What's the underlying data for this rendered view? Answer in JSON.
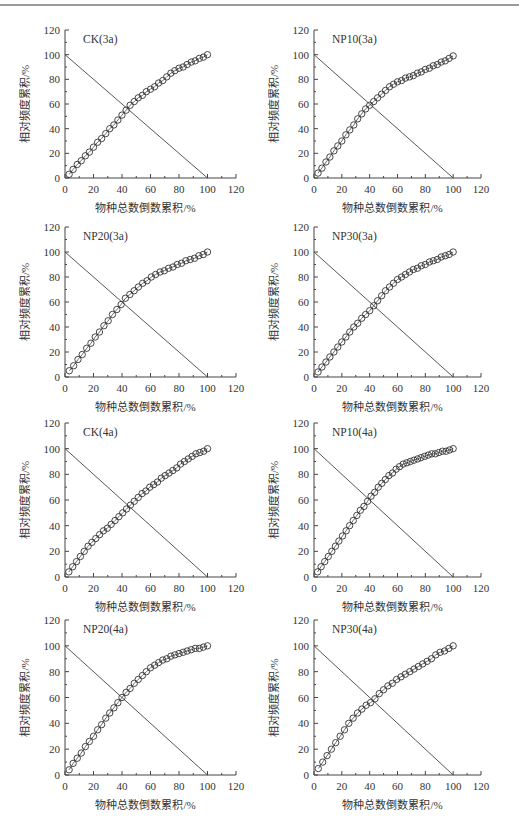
{
  "page": {
    "header_rule": true
  },
  "chart_data": [
    {
      "id": "ck-3a",
      "type": "scatter",
      "title": "CK(3a)",
      "xlabel": "物种总数倒数累积/%",
      "ylabel": "相对频度累积/%",
      "xlim": [
        0,
        120
      ],
      "ylim": [
        0,
        120
      ],
      "xticks": [
        0,
        20,
        40,
        60,
        80,
        100,
        120
      ],
      "yticks": [
        0,
        20,
        40,
        60,
        80,
        100,
        120
      ],
      "grid": false,
      "reference_line": {
        "x": [
          0,
          100
        ],
        "y": [
          100,
          0
        ]
      },
      "series": [
        {
          "name": "cumulative",
          "marker": "open-circle",
          "x": [
            2.9,
            5.7,
            8.6,
            11.4,
            14.3,
            17.1,
            20,
            22.9,
            25.7,
            28.6,
            31.4,
            34.3,
            37.1,
            40,
            42.9,
            45.7,
            48.6,
            51.4,
            54.3,
            57.1,
            60,
            62.9,
            65.7,
            68.6,
            71.4,
            74.3,
            77.1,
            80,
            82.9,
            85.7,
            88.6,
            91.4,
            94.3,
            97.1,
            100
          ],
          "y": [
            3,
            7,
            11,
            14,
            18,
            21,
            25,
            29,
            32,
            36,
            40,
            43,
            47,
            51,
            55,
            59,
            62,
            65,
            67,
            70,
            72,
            74,
            77,
            79,
            82,
            85,
            87,
            89,
            90,
            92,
            94,
            95,
            97,
            98,
            100
          ]
        }
      ]
    },
    {
      "id": "np10-3a",
      "type": "scatter",
      "title": "NP10(3a)",
      "xlabel": "物种总数倒数累积/%",
      "ylabel": "相对频度累积/%",
      "xlim": [
        0,
        120
      ],
      "ylim": [
        0,
        120
      ],
      "xticks": [
        0,
        20,
        40,
        60,
        80,
        100,
        120
      ],
      "yticks": [
        0,
        20,
        40,
        60,
        80,
        100,
        120
      ],
      "grid": false,
      "reference_line": {
        "x": [
          0,
          100
        ],
        "y": [
          100,
          0
        ]
      },
      "series": [
        {
          "name": "cumulative",
          "marker": "open-circle",
          "x": [
            2.9,
            5.7,
            8.6,
            11.4,
            14.3,
            17.1,
            20,
            22.9,
            25.7,
            28.6,
            31.4,
            34.3,
            37.1,
            40,
            42.9,
            45.7,
            48.6,
            51.4,
            54.3,
            57.1,
            60,
            62.9,
            65.7,
            68.6,
            71.4,
            74.3,
            77.1,
            80,
            82.9,
            85.7,
            88.6,
            91.4,
            94.3,
            97.1,
            100
          ],
          "y": [
            4,
            8,
            13,
            17,
            22,
            26,
            30,
            35,
            39,
            43,
            48,
            52,
            56,
            59,
            62,
            65,
            68,
            71,
            74,
            76,
            78,
            79,
            81,
            82,
            83,
            85,
            86,
            88,
            89,
            91,
            92,
            94,
            95,
            97,
            99
          ]
        }
      ]
    },
    {
      "id": "np20-3a",
      "type": "scatter",
      "title": "NP20(3a)",
      "xlabel": "物种总数倒数累积/%",
      "ylabel": "相对频度累积/%",
      "xlim": [
        0,
        120
      ],
      "ylim": [
        0,
        120
      ],
      "xticks": [
        0,
        20,
        40,
        60,
        80,
        100,
        120
      ],
      "yticks": [
        0,
        20,
        40,
        60,
        80,
        100,
        120
      ],
      "grid": false,
      "reference_line": {
        "x": [
          0,
          100
        ],
        "y": [
          100,
          0
        ]
      },
      "series": [
        {
          "name": "cumulative",
          "marker": "open-circle",
          "x": [
            3.0,
            6.1,
            9.1,
            12.1,
            15.2,
            18.2,
            21.2,
            24.2,
            27.3,
            30.3,
            33.3,
            36.4,
            39.4,
            42.4,
            45.5,
            48.5,
            51.5,
            54.5,
            57.6,
            60.6,
            63.6,
            66.7,
            69.7,
            72.7,
            75.8,
            78.8,
            81.8,
            84.8,
            87.9,
            90.9,
            93.9,
            97.0,
            100
          ],
          "y": [
            5,
            9,
            14,
            18,
            23,
            27,
            32,
            36,
            41,
            45,
            50,
            54,
            58,
            63,
            66,
            69,
            72,
            75,
            77,
            80,
            82,
            84,
            85,
            87,
            88,
            90,
            91,
            93,
            94,
            95,
            97,
            98,
            100
          ]
        }
      ]
    },
    {
      "id": "np30-3a",
      "type": "scatter",
      "title": "NP30(3a)",
      "xlabel": "物种总数倒数累积/%",
      "ylabel": "相对频度累积/%",
      "xlim": [
        0,
        120
      ],
      "ylim": [
        0,
        120
      ],
      "xticks": [
        0,
        20,
        40,
        60,
        80,
        100,
        120
      ],
      "yticks": [
        0,
        20,
        40,
        60,
        80,
        100,
        120
      ],
      "grid": false,
      "reference_line": {
        "x": [
          0,
          100
        ],
        "y": [
          100,
          0
        ]
      },
      "series": [
        {
          "name": "cumulative",
          "marker": "open-circle",
          "x": [
            2.9,
            5.7,
            8.6,
            11.4,
            14.3,
            17.1,
            20,
            22.9,
            25.7,
            28.6,
            31.4,
            34.3,
            37.1,
            40,
            42.9,
            45.7,
            48.6,
            51.4,
            54.3,
            57.1,
            60,
            62.9,
            65.7,
            68.6,
            71.4,
            74.3,
            77.1,
            80,
            82.9,
            85.7,
            88.6,
            91.4,
            94.3,
            97.1,
            100
          ],
          "y": [
            4,
            8,
            12,
            16,
            20,
            24,
            28,
            32,
            36,
            40,
            43,
            47,
            50,
            53,
            57,
            61,
            65,
            69,
            72,
            75,
            78,
            80,
            82,
            84,
            86,
            87,
            89,
            90,
            92,
            93,
            94,
            96,
            97,
            98,
            100
          ]
        }
      ]
    },
    {
      "id": "ck-4a",
      "type": "scatter",
      "title": "CK(4a)",
      "xlabel": "物种总数倒数累积/%",
      "ylabel": "相对频度累积/%",
      "xlim": [
        0,
        120
      ],
      "ylim": [
        0,
        120
      ],
      "xticks": [
        0,
        20,
        40,
        60,
        80,
        100,
        120
      ],
      "yticks": [
        0,
        20,
        40,
        60,
        80,
        100,
        120
      ],
      "grid": false,
      "reference_line": {
        "x": [
          0,
          100
        ],
        "y": [
          100,
          0
        ]
      },
      "series": [
        {
          "name": "cumulative",
          "marker": "open-circle",
          "x": [
            2.7,
            5.4,
            8.1,
            10.8,
            13.5,
            16.2,
            18.9,
            21.6,
            24.3,
            27,
            29.7,
            32.4,
            35.1,
            37.8,
            40.5,
            43.2,
            45.9,
            48.6,
            51.4,
            54.1,
            56.8,
            59.5,
            62.2,
            64.9,
            67.6,
            70.3,
            73,
            75.7,
            78.4,
            81.1,
            83.8,
            86.5,
            89.2,
            91.9,
            94.6,
            97.3,
            100
          ],
          "y": [
            4,
            8,
            12,
            16,
            20,
            24,
            27,
            30,
            33,
            36,
            38,
            41,
            44,
            47,
            50,
            53,
            56,
            59,
            62,
            65,
            67,
            70,
            72,
            74,
            77,
            79,
            81,
            83,
            85,
            88,
            90,
            92,
            94,
            96,
            97,
            98,
            100
          ]
        }
      ]
    },
    {
      "id": "np10-4a",
      "type": "scatter",
      "title": "NP10(4a)",
      "xlabel": "物种总数倒数累积/%",
      "ylabel": "相对频度累积/%",
      "xlim": [
        0,
        120
      ],
      "ylim": [
        0,
        120
      ],
      "xticks": [
        0,
        20,
        40,
        60,
        80,
        100,
        120
      ],
      "yticks": [
        0,
        20,
        40,
        60,
        80,
        100,
        120
      ],
      "grid": false,
      "reference_line": {
        "x": [
          0,
          100
        ],
        "y": [
          100,
          0
        ]
      },
      "series": [
        {
          "name": "cumulative",
          "marker": "open-circle",
          "x": [
            2.6,
            5.1,
            7.7,
            10.3,
            12.8,
            15.4,
            17.9,
            20.5,
            23.1,
            25.6,
            28.2,
            30.8,
            33.3,
            35.9,
            38.5,
            41,
            43.6,
            46.2,
            48.7,
            51.3,
            53.8,
            56.4,
            59,
            61.5,
            64.1,
            66.7,
            69.2,
            71.8,
            74.4,
            76.9,
            79.5,
            82.1,
            84.6,
            87.2,
            89.7,
            92.3,
            94.9,
            97.4,
            100
          ],
          "y": [
            4,
            8,
            12,
            16,
            20,
            24,
            28,
            32,
            36,
            40,
            44,
            48,
            52,
            55,
            59,
            63,
            66,
            70,
            73,
            76,
            79,
            81,
            84,
            86,
            88,
            89,
            90,
            91,
            92,
            93,
            94,
            95,
            96,
            96,
            97,
            98,
            98,
            99,
            100
          ]
        }
      ]
    },
    {
      "id": "np20-4a",
      "type": "scatter",
      "title": "NP20(4a)",
      "xlabel": "物种总数倒数累积/%",
      "ylabel": "相对频度累积/%",
      "xlim": [
        0,
        120
      ],
      "ylim": [
        0,
        120
      ],
      "xticks": [
        0,
        20,
        40,
        60,
        80,
        100,
        120
      ],
      "yticks": [
        0,
        20,
        40,
        60,
        80,
        100,
        120
      ],
      "grid": false,
      "reference_line": {
        "x": [
          0,
          100
        ],
        "y": [
          100,
          0
        ]
      },
      "series": [
        {
          "name": "cumulative",
          "marker": "open-circle",
          "x": [
            2.9,
            5.7,
            8.6,
            11.4,
            14.3,
            17.1,
            20,
            22.9,
            25.7,
            28.6,
            31.4,
            34.3,
            37.1,
            40,
            42.9,
            45.7,
            48.6,
            51.4,
            54.3,
            57.1,
            60,
            62.9,
            65.7,
            68.6,
            71.4,
            74.3,
            77.1,
            80,
            82.9,
            85.7,
            88.6,
            91.4,
            94.3,
            97.1,
            100
          ],
          "y": [
            4,
            9,
            13,
            17,
            22,
            26,
            30,
            35,
            39,
            44,
            48,
            52,
            56,
            60,
            64,
            67,
            71,
            74,
            77,
            80,
            83,
            85,
            87,
            89,
            90,
            92,
            93,
            94,
            95,
            96,
            97,
            98,
            98,
            99,
            100
          ]
        }
      ]
    },
    {
      "id": "np30-4a",
      "type": "scatter",
      "title": "NP30(4a)",
      "xlabel": "物种总数倒数累积/%",
      "ylabel": "相对频度累积/%",
      "xlim": [
        0,
        120
      ],
      "ylim": [
        0,
        120
      ],
      "xticks": [
        0,
        20,
        40,
        60,
        80,
        100,
        120
      ],
      "yticks": [
        0,
        20,
        40,
        60,
        80,
        100,
        120
      ],
      "grid": false,
      "reference_line": {
        "x": [
          0,
          100
        ],
        "y": [
          100,
          0
        ]
      },
      "series": [
        {
          "name": "cumulative",
          "marker": "open-circle",
          "x": [
            3.1,
            6.3,
            9.4,
            12.5,
            15.6,
            18.8,
            21.9,
            25,
            28.1,
            31.3,
            34.4,
            37.5,
            40.6,
            43.8,
            46.9,
            50,
            53.1,
            56.3,
            59.4,
            62.5,
            65.6,
            68.8,
            71.9,
            75,
            78.1,
            81.3,
            84.4,
            87.5,
            90.6,
            93.8,
            96.9,
            100
          ],
          "y": [
            5,
            10,
            15,
            20,
            25,
            30,
            35,
            40,
            44,
            48,
            51,
            54,
            56,
            59,
            63,
            66,
            69,
            71,
            74,
            76,
            78,
            80,
            82,
            84,
            86,
            88,
            90,
            93,
            95,
            96,
            98,
            100
          ]
        }
      ]
    }
  ],
  "layout": {
    "panels": [
      {
        "left": 65,
        "top": 30,
        "plotW": 171,
        "plotH": 148
      },
      {
        "left": 314,
        "top": 30,
        "plotW": 167,
        "plotH": 148
      },
      {
        "left": 65,
        "top": 227,
        "plotW": 171,
        "plotH": 150
      },
      {
        "left": 314,
        "top": 227,
        "plotW": 167,
        "plotH": 150
      },
      {
        "left": 65,
        "top": 423,
        "plotW": 171,
        "plotH": 154
      },
      {
        "left": 314,
        "top": 423,
        "plotW": 167,
        "plotH": 154
      },
      {
        "left": 65,
        "top": 620,
        "plotW": 171,
        "plotH": 155
      },
      {
        "left": 314,
        "top": 620,
        "plotW": 167,
        "plotH": 155
      }
    ],
    "colors": {
      "axis": "#444444",
      "marker": "#333333",
      "line": "#444444",
      "text": "#333333"
    }
  }
}
